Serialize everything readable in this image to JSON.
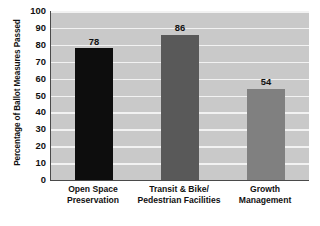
{
  "chart_data": {
    "type": "bar",
    "title": "",
    "xlabel": "",
    "ylabel": "Percentage of Ballot Measures Passed",
    "ylim": [
      0,
      100
    ],
    "ytick_step": 10,
    "yticks": [
      100,
      90,
      80,
      70,
      60,
      50,
      40,
      30,
      20,
      10,
      0
    ],
    "grid": true,
    "legend": "none",
    "categories": [
      "Open Space Preservation",
      "Transit & Bike/ Pedestrian Facilities",
      "Growth Management"
    ],
    "category_lines": [
      [
        "Open Space",
        "Preservation"
      ],
      [
        "Transit & Bike/",
        "Pedestrian Facilities"
      ],
      [
        "Growth",
        "Management"
      ]
    ],
    "values": [
      78,
      86,
      54
    ],
    "value_labels": [
      "78",
      "86",
      "54"
    ],
    "bar_colors": [
      "#0d0d0d",
      "#595959",
      "#808080"
    ],
    "plot_background": "#c9c9c9",
    "gridline_color": "#f2f2f2",
    "axis_color": "#4a4a4a",
    "figure_background": "#ffffff"
  }
}
